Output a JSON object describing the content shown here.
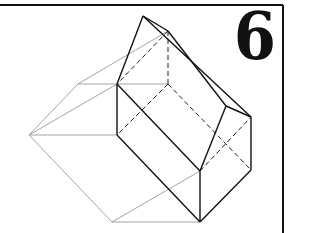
{
  "figure": {
    "number_label": "6",
    "colors": {
      "ink": "#111111",
      "construction": "#9a9a9a",
      "frame": "#111111",
      "background": "#ffffff"
    },
    "frame": {
      "top_y": 5,
      "right_x": 283,
      "left_x": 0,
      "bottom_y": 233
    },
    "vertices": {
      "A": [
        143,
        16
      ],
      "B": [
        168,
        31
      ],
      "C": [
        117,
        84
      ],
      "D": [
        168,
        84
      ],
      "E": [
        78,
        84
      ],
      "F": [
        29,
        135
      ],
      "G": [
        117,
        135
      ],
      "H": [
        226,
        106
      ],
      "I": [
        251,
        117
      ],
      "J": [
        200,
        171
      ],
      "K": [
        251,
        170
      ],
      "L": [
        200,
        222
      ],
      "M": [
        112,
        222
      ]
    },
    "edges": {
      "solid": [
        [
          "A",
          "B"
        ],
        [
          "A",
          "C"
        ],
        [
          "A",
          "I"
        ],
        [
          "B",
          "H"
        ],
        [
          "H",
          "I"
        ],
        [
          "H",
          "J"
        ],
        [
          "C",
          "G"
        ],
        [
          "C",
          "J"
        ],
        [
          "G",
          "L"
        ],
        [
          "J",
          "L"
        ],
        [
          "I",
          "K"
        ],
        [
          "K",
          "L"
        ]
      ],
      "dashed": [
        [
          "B",
          "D"
        ],
        [
          "B",
          "C"
        ],
        [
          "D",
          "G"
        ],
        [
          "D",
          "K"
        ],
        [
          "J",
          "I"
        ]
      ],
      "construction": [
        [
          "E",
          "C"
        ],
        [
          "C",
          "D"
        ],
        [
          "E",
          "B"
        ],
        [
          "F",
          "E"
        ],
        [
          "F",
          "C"
        ],
        [
          "F",
          "G"
        ],
        [
          "F",
          "M"
        ],
        [
          "M",
          "L"
        ],
        [
          "M",
          "J"
        ]
      ]
    }
  }
}
